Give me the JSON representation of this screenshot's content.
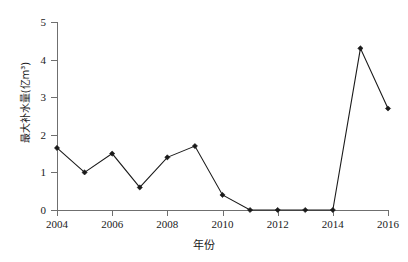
{
  "chart_data": {
    "type": "line",
    "title": "",
    "xlabel": "年份",
    "ylabel": "最大补水量(亿m³)",
    "x": [
      2004,
      2005,
      2006,
      2007,
      2008,
      2009,
      2010,
      2011,
      2012,
      2013,
      2014,
      2015,
      2016
    ],
    "values": [
      1.65,
      1.0,
      1.5,
      0.6,
      1.4,
      1.7,
      0.4,
      0.0,
      0.0,
      0.0,
      0.0,
      4.3,
      2.7
    ],
    "series": [
      {
        "name": "最大补水量",
        "values": [
          1.65,
          1.0,
          1.5,
          0.6,
          1.4,
          1.7,
          0.4,
          0.0,
          0.0,
          0.0,
          0.0,
          4.3,
          2.7
        ]
      }
    ],
    "xlim": [
      2004,
      2016
    ],
    "ylim": [
      0,
      5
    ],
    "ytick_labels": [
      "0",
      "1",
      "2",
      "3",
      "4",
      "5"
    ],
    "ytick_values": [
      0,
      1,
      2,
      3,
      4,
      5
    ],
    "xtick_labels": [
      "2004",
      "2006",
      "2008",
      "2010",
      "2012",
      "2014",
      "2016"
    ],
    "xtick_values": [
      2004,
      2006,
      2008,
      2010,
      2012,
      2014,
      2016
    ],
    "grid": false,
    "legend": false,
    "legend_position": "none",
    "marker": "diamond",
    "line_color": "#1a1a1a",
    "marker_color": "#1a1a1a",
    "background_color": "#ffffff",
    "axis_color": "#6f6f6f"
  }
}
